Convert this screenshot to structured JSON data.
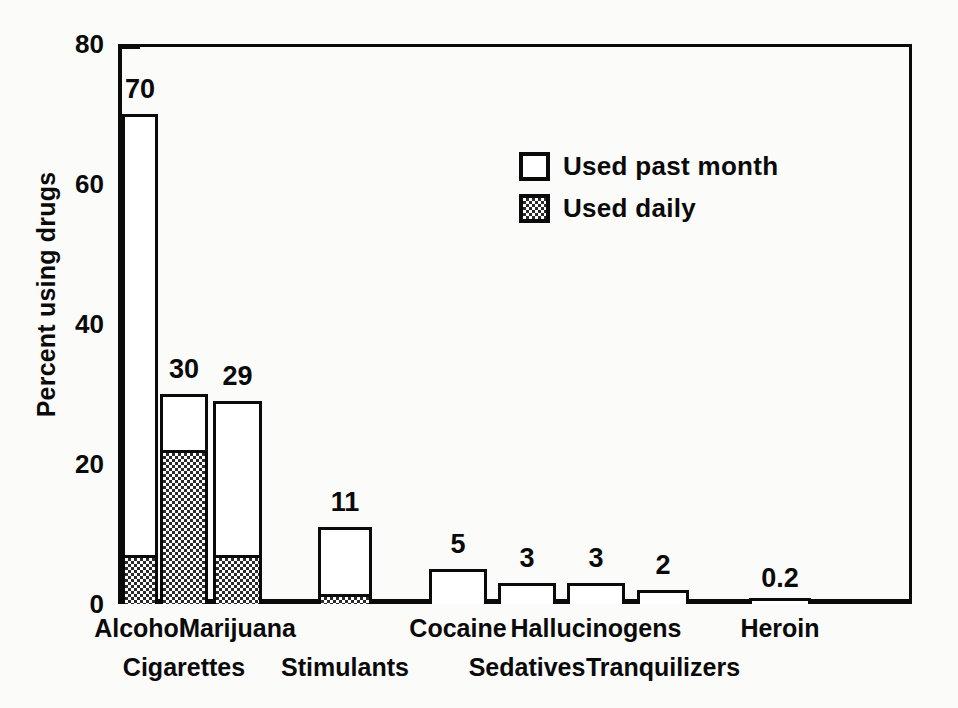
{
  "chart_data": {
    "type": "bar",
    "title": "",
    "xlabel": "",
    "ylabel": "Percent using drugs",
    "ylim": [
      0,
      80
    ],
    "grid": false,
    "legend_position": "inside-upper-right",
    "stacked": true,
    "categories": [
      "Alcohol",
      "Cigarettes",
      "Marijuana",
      "Stimulants",
      "Cocaine",
      "Sedatives",
      "Hallucinogens",
      "Tranquilizers",
      "Heroin"
    ],
    "y_ticks_major": [
      0,
      20,
      40,
      60,
      80
    ],
    "y_ticks_minor": [
      10,
      30,
      50,
      70
    ],
    "series": [
      {
        "name": "Used past month",
        "fill": "open",
        "values": [
          70,
          30,
          29,
          11,
          5,
          3,
          3,
          2,
          0.2
        ],
        "labels": [
          "70",
          "30",
          "29",
          "11",
          "5",
          "3",
          "3",
          "2",
          "0.2"
        ]
      },
      {
        "name": "Used daily",
        "fill": "checkered",
        "values": [
          7,
          22,
          7,
          1.5,
          0,
          0,
          0,
          0,
          0
        ],
        "labels": [
          "",
          "",
          "",
          "",
          "",
          "",
          "",
          "",
          ""
        ]
      }
    ]
  },
  "axes": {
    "y_title": "Percent using drugs",
    "y_tick_labels": [
      "80",
      "60",
      "40",
      "20",
      "0"
    ],
    "y_tick_values": [
      80,
      60,
      40,
      20,
      0
    ]
  },
  "legend": {
    "items": [
      {
        "label": "Used past month",
        "swatch": "open-square"
      },
      {
        "label": "Used daily",
        "swatch": "checkered-square"
      }
    ]
  },
  "colors": {
    "ink": "#0a0a0a",
    "paper": "#fbfbf9",
    "bar_fill": "#ffffff",
    "hatch": "#2b2b2b"
  }
}
